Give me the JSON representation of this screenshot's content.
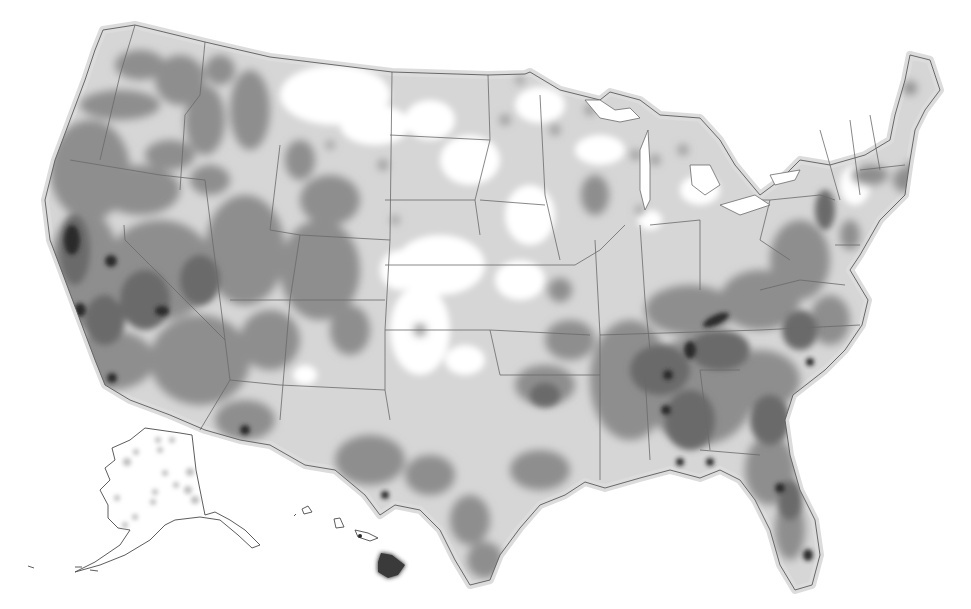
{
  "map": {
    "type": "density-heatmap",
    "region": "United States",
    "projection": "Albers-style conic with Alaska and Hawaii insets",
    "color_scheme": "greyscale",
    "colors": {
      "background": "#ffffff",
      "land_base": "#cfcfcf",
      "low_density": "#c4c4c4",
      "medium_density": "#8e8e8e",
      "high_density": "#6a6a6a",
      "very_high_density": "#2a2a2a",
      "state_border": "#6a6a6a"
    },
    "insets": [
      "Alaska",
      "Hawaii"
    ],
    "has_legend": false,
    "has_title": false,
    "has_labels": false,
    "hotspots": [
      {
        "area": "Northern California coast",
        "level": "very-high"
      },
      {
        "area": "Sierra Nevada / central California",
        "level": "very-high"
      },
      {
        "area": "Southern California",
        "level": "very-high"
      },
      {
        "area": "Eastern Tennessee / Appalachians",
        "level": "very-high"
      },
      {
        "area": "Northern Alabama",
        "level": "very-high"
      },
      {
        "area": "Central Florida",
        "level": "high"
      },
      {
        "area": "Southeast Florida",
        "level": "high"
      },
      {
        "area": "Hawaii (Big Island)",
        "level": "very-high"
      },
      {
        "area": "West Virginia / Virginia ridge",
        "level": "very-high"
      }
    ],
    "sparse_areas": [
      "Eastern Montana",
      "Western Dakotas",
      "Western Kansas / Nebraska",
      "Texas Panhandle / Eastern New Mexico",
      "Iowa",
      "Alaska interior"
    ]
  }
}
